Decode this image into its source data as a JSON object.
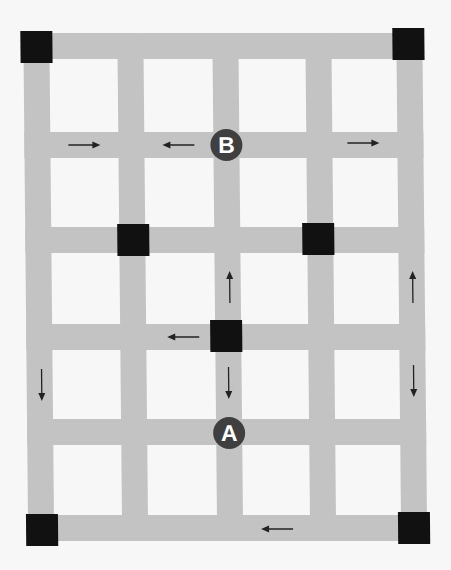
{
  "diagram": {
    "type": "street-grid-map",
    "colors": {
      "background": "#f7f7f7",
      "road": "#c3c3c3",
      "block": "#ffffff",
      "intersection_node": "#111111",
      "marker": "#3f3f3f",
      "arrow": "#222222"
    },
    "vertical_roads_x": [
      36,
      130,
      225,
      318,
      409
    ],
    "horizontal_roads_y": [
      46,
      145,
      240,
      337,
      432,
      528
    ],
    "road_width": 26,
    "markers": [
      {
        "label": "B",
        "x": 225,
        "y": 145
      },
      {
        "label": "A",
        "x": 227,
        "y": 433
      }
    ],
    "nodes": [
      {
        "name": "top-left",
        "x": 36,
        "y": 47
      },
      {
        "name": "top-right",
        "x": 408,
        "y": 44
      },
      {
        "name": "mid-left",
        "x": 131,
        "y": 240
      },
      {
        "name": "mid-right",
        "x": 316,
        "y": 239
      },
      {
        "name": "center",
        "x": 223,
        "y": 336
      },
      {
        "name": "bottom-left",
        "x": 40,
        "y": 530
      },
      {
        "name": "bottom-right",
        "x": 412,
        "y": 528
      }
    ],
    "arrows": [
      {
        "direction": "right",
        "x": 83,
        "y": 145
      },
      {
        "direction": "left",
        "x": 177,
        "y": 145
      },
      {
        "direction": "right",
        "x": 362,
        "y": 143
      },
      {
        "direction": "up",
        "x": 227,
        "y": 287
      },
      {
        "direction": "up",
        "x": 411,
        "y": 287
      },
      {
        "direction": "left",
        "x": 180,
        "y": 337
      },
      {
        "direction": "down",
        "x": 39,
        "y": 385
      },
      {
        "direction": "down",
        "x": 227,
        "y": 383
      },
      {
        "direction": "down",
        "x": 411,
        "y": 381
      },
      {
        "direction": "left",
        "x": 272,
        "y": 529
      }
    ]
  }
}
